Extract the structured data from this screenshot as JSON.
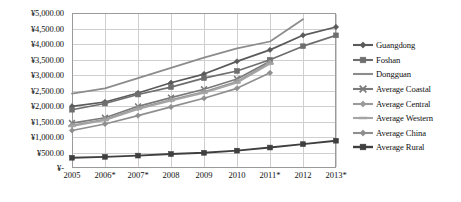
{
  "chart_data": {
    "type": "line",
    "title": "",
    "xlabel": "",
    "ylabel": "",
    "ylim": [
      0,
      5000
    ],
    "ytick_labels": [
      "¥-",
      "¥500.00",
      "¥1,000.00",
      "¥1,500.00",
      "¥2,000.00",
      "¥2,500.00",
      "¥3,000.00",
      "¥3,500.00",
      "¥4,000.00",
      "¥4,500.00",
      "¥5,000.00"
    ],
    "ytick_values": [
      0,
      500,
      1000,
      1500,
      2000,
      2500,
      3000,
      3500,
      4000,
      4500,
      5000
    ],
    "categories": [
      "2005",
      "2006*",
      "2007*",
      "2008",
      "2009",
      "2010",
      "2011*",
      "2012",
      "2013*"
    ],
    "grid": true,
    "legend_position": "right",
    "currency_symbol": "¥",
    "series": [
      {
        "name": "Guangdong",
        "marker": "diamond",
        "color": "#5a5a5a",
        "values": [
          1990,
          2130,
          2420,
          2750,
          3030,
          3440,
          3810,
          4280,
          4550
        ]
      },
      {
        "name": "Foshan",
        "marker": "square",
        "color": "#6e6e6e",
        "values": [
          1880,
          2080,
          2370,
          2610,
          2900,
          3130,
          3490,
          3930,
          4280
        ]
      },
      {
        "name": "Dongguan",
        "marker": "none",
        "color": "#8c8c8c",
        "values": [
          2400,
          2570,
          2900,
          3230,
          3560,
          3860,
          4080,
          4800,
          null
        ]
      },
      {
        "name": "Average Coastal",
        "marker": "cross",
        "color": "#7a7a7a",
        "values": [
          1450,
          1620,
          1990,
          2270,
          2540,
          2870,
          3440,
          null,
          null
        ]
      },
      {
        "name": "Average Central",
        "marker": "diamond",
        "color": "#9a9a9a",
        "values": [
          1380,
          1570,
          1930,
          2200,
          2460,
          2790,
          3400,
          null,
          null
        ]
      },
      {
        "name": "Average Western",
        "marker": "dash",
        "color": "#a5a5a5",
        "values": [
          1350,
          1540,
          1900,
          2170,
          2420,
          2750,
          3360,
          null,
          null
        ]
      },
      {
        "name": "Average China",
        "marker": "diamond",
        "color": "#8f8f8f",
        "values": [
          1210,
          1420,
          1690,
          1970,
          2250,
          2570,
          3070,
          null,
          null
        ]
      },
      {
        "name": "Average Rural",
        "marker": "square",
        "color": "#3f3f3f",
        "values": [
          330,
          360,
          400,
          450,
          490,
          560,
          660,
          770,
          880
        ]
      }
    ]
  }
}
